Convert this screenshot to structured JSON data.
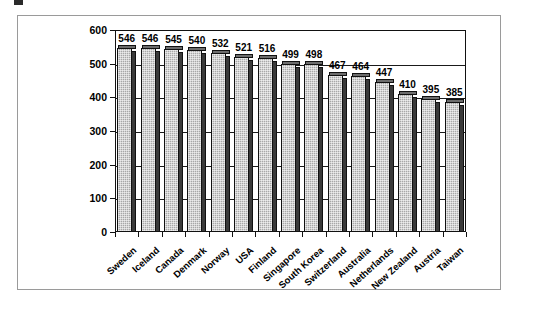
{
  "chart_data": {
    "type": "bar",
    "title": "",
    "xlabel": "",
    "ylabel": "",
    "ylim": [
      0,
      600
    ],
    "ytick_step": 100,
    "yticks": [
      "0",
      "100",
      "200",
      "300",
      "400",
      "500",
      "600"
    ],
    "grid": true,
    "legend": "none",
    "categories": [
      "Sweden",
      "Iceland",
      "Canada",
      "Denmark",
      "Norway",
      "USA",
      "Finland",
      "Singapore",
      "South Korea",
      "Switzerland",
      "Australia",
      "Netherlands",
      "New Zealand",
      "Austria",
      "Taiwan"
    ],
    "values": [
      546,
      546,
      545,
      540,
      532,
      521,
      516,
      499,
      498,
      467,
      464,
      447,
      410,
      395,
      385
    ],
    "value_labels": [
      "546",
      "546",
      "545",
      "540",
      "532",
      "521",
      "516",
      "499",
      "498",
      "467",
      "464",
      "447",
      "410",
      "395",
      "385"
    ],
    "bar_fill_color": "#a8a8a8",
    "bar_edge_color": "#111111",
    "bar_shadow_color": "#3a3a3a",
    "axis_color": "#111111",
    "frame_color": "#9a9a9a",
    "background_color": "#ffffff"
  }
}
